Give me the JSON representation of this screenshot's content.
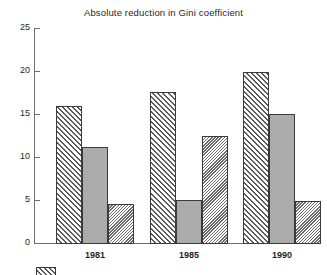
{
  "chart_data": {
    "type": "bar",
    "title": "Absolute reduction in Gini coefficient",
    "xlabel": "",
    "ylabel": "",
    "categories": [
      "1981",
      "1985",
      "1990"
    ],
    "series": [
      {
        "name": "series-1",
        "fill": "diagonal-hatch-forward",
        "color": "#ffffff",
        "values": [
          16.0,
          17.7,
          20.0
        ]
      },
      {
        "name": "series-2",
        "fill": "solid-gray",
        "color": "#ababab",
        "values": [
          11.3,
          5.1,
          15.1
        ]
      },
      {
        "name": "series-3",
        "fill": "diagonal-hatch-backward",
        "color": "#ffffff",
        "values": [
          4.7,
          12.6,
          5.0
        ]
      }
    ],
    "ylim": [
      0,
      25
    ],
    "yticks": [
      0,
      5,
      10,
      15,
      20,
      25
    ],
    "ytick_labels": [
      "0",
      "5",
      "10",
      "15",
      "20",
      "25"
    ],
    "grid": false,
    "legend_position": "bottom-left"
  },
  "axes": {
    "y_ticks": [
      {
        "value": 25,
        "label": "25"
      },
      {
        "value": 20,
        "label": "20"
      },
      {
        "value": 15,
        "label": "15"
      },
      {
        "value": 10,
        "label": "10"
      },
      {
        "value": 5,
        "label": "5"
      },
      {
        "value": 0,
        "label": "0"
      }
    ],
    "x_categories": [
      "1981",
      "1985",
      "1990"
    ]
  },
  "legend": {
    "entries": [
      {
        "label": "",
        "fill": "diagonal-hatch-forward"
      }
    ]
  },
  "colors": {
    "axis": "#6e6e6e",
    "bar_outline": "#3a3a3a",
    "solid_fill": "#ababab",
    "hatch_stroke": "#5a5a5a",
    "background": "#ffffff",
    "text": "#1f1f1f"
  }
}
